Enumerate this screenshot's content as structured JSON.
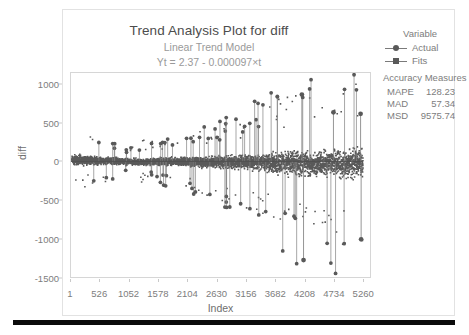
{
  "chart_data": {
    "type": "scatter",
    "title": "Trend Analysis Plot for diff",
    "subtitle": "Linear Trend Model",
    "equation": "Yt = 2.37 - 0.000097×t",
    "xlabel": "Index",
    "ylabel": "diff",
    "xlim": [
      1,
      5400
    ],
    "ylim": [
      -1500,
      1150
    ],
    "grid": false,
    "legend_position": "right",
    "xticks": [
      1,
      526,
      1052,
      1578,
      2104,
      2630,
      3156,
      3682,
      4208,
      4734,
      5260
    ],
    "yticks": [
      1000,
      500,
      0,
      -500,
      -1000,
      -1500
    ],
    "legend_title": "Variable",
    "series": [
      {
        "name": "Actual",
        "marker": "circle",
        "color": "#595959"
      },
      {
        "name": "Fits",
        "marker": "square",
        "color": "#595959"
      }
    ],
    "fit_line": {
      "intercept": 2.37,
      "slope": -9.7e-05
    },
    "outliers": [
      {
        "index": 4170,
        "value": 870
      },
      {
        "index": 4200,
        "value": -1280
      },
      {
        "index": 5240,
        "value": -1010
      },
      {
        "index": 4740,
        "value": 640
      },
      {
        "index": 5230,
        "value": 620
      }
    ],
    "band_envelope": {
      "x": [
        1,
        300,
        700,
        1100,
        1500,
        1900,
        2300,
        2700,
        3100,
        3500,
        3900,
        4300,
        4700,
        5100,
        5260
      ],
      "upper": [
        180,
        150,
        120,
        95,
        105,
        130,
        150,
        175,
        200,
        235,
        300,
        330,
        345,
        390,
        400
      ],
      "lower": [
        -120,
        -100,
        -85,
        -80,
        -95,
        -115,
        -140,
        -165,
        -195,
        -240,
        -320,
        -360,
        -370,
        -420,
        -430
      ]
    }
  },
  "accuracy": {
    "title": "Accuracy Measures",
    "rows": [
      {
        "key": "MAPE",
        "value": "128.23"
      },
      {
        "key": "MAD",
        "value": "57.34"
      },
      {
        "key": "MSD",
        "value": "9575.74"
      }
    ]
  },
  "colors": {
    "data": "#595959",
    "axis": "#d6d6d6",
    "tick_text": "#7d7d7d",
    "title": "#4d4d4d",
    "subtitle": "#9a9a9a"
  }
}
